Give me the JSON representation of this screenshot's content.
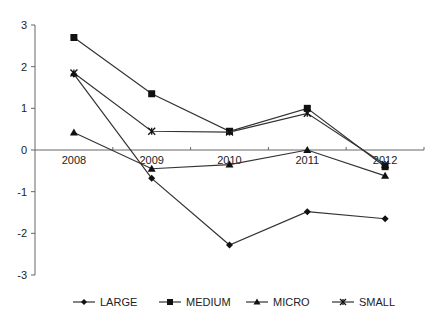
{
  "chart_data": {
    "type": "line",
    "title": "",
    "xlabel": "",
    "ylabel": "",
    "categories": [
      "2008",
      "2009",
      "2010",
      "2011",
      "2012"
    ],
    "ylim": [
      -3,
      3
    ],
    "yticks": [
      -3,
      -2,
      -1,
      0,
      1,
      2,
      3
    ],
    "grid": false,
    "legend_position": "bottom",
    "series": [
      {
        "name": "LARGE",
        "marker": "diamond",
        "values": [
          1.82,
          -0.68,
          -2.28,
          -1.48,
          -1.65
        ]
      },
      {
        "name": "MEDIUM",
        "marker": "square",
        "values": [
          2.7,
          1.35,
          0.45,
          1.0,
          -0.4
        ]
      },
      {
        "name": "MICRO",
        "marker": "triangle",
        "values": [
          0.42,
          -0.45,
          -0.35,
          0.0,
          -0.62
        ]
      },
      {
        "name": "SMALL",
        "marker": "star",
        "values": [
          1.85,
          0.45,
          0.43,
          0.88,
          -0.35
        ]
      }
    ]
  },
  "colors": {
    "line": "#333333",
    "axis": "#666666",
    "text": "#222222"
  }
}
